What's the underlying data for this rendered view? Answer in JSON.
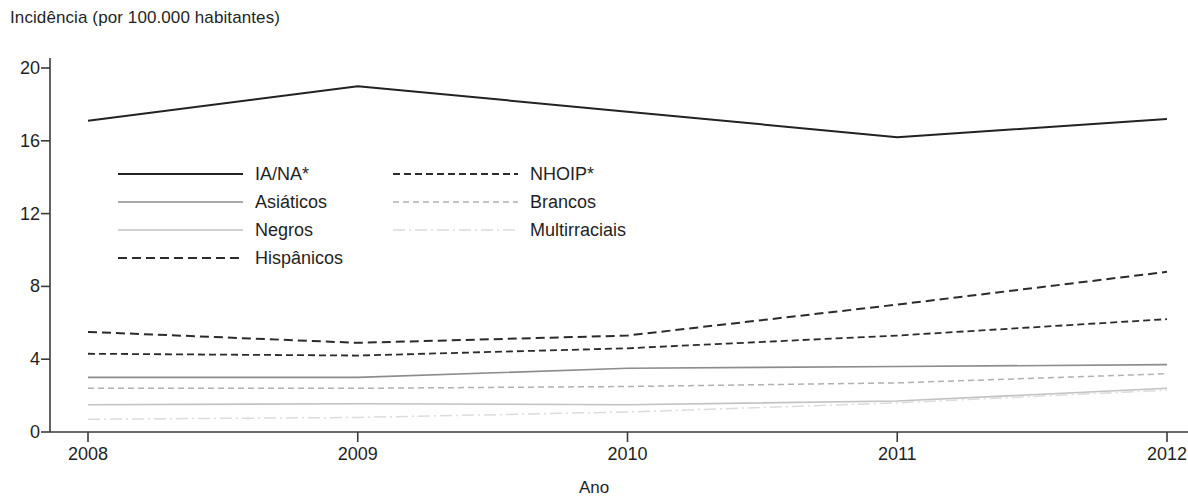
{
  "chart_data": {
    "type": "line",
    "title": "",
    "ylabel": "Incidência (por 100.000 habitantes)",
    "xlabel": "Ano",
    "x": [
      2008,
      2009,
      2010,
      2011,
      2012
    ],
    "categories": [
      "2008",
      "2009",
      "2010",
      "2011",
      "2012"
    ],
    "xtick_labels": [
      "2008",
      "2009",
      "2010",
      "2011",
      "2012"
    ],
    "ytick_labels": [
      "0",
      "4",
      "8",
      "12",
      "16",
      "20"
    ],
    "yticks": [
      0,
      4,
      8,
      12,
      16,
      20
    ],
    "ylim": [
      0,
      20
    ],
    "xlim": [
      2008,
      2012
    ],
    "grid": false,
    "legend_position": "upper-left-inside",
    "footnote": "",
    "series": [
      {
        "name": "IA/NA*",
        "style": "solid",
        "color": "#222222",
        "width": 2.0,
        "values": [
          17.1,
          19.0,
          17.6,
          16.2,
          17.2
        ]
      },
      {
        "name": "Asiáticos",
        "style": "solid",
        "color": "#8c8c8c",
        "width": 1.6,
        "values": [
          3.0,
          3.0,
          3.5,
          3.6,
          3.7
        ]
      },
      {
        "name": "Negros",
        "style": "solid",
        "color": "#c2c2c2",
        "width": 1.6,
        "values": [
          1.5,
          1.55,
          1.5,
          1.7,
          2.4
        ]
      },
      {
        "name": "Hispânicos",
        "style": "dashed",
        "color": "#2b2b2b",
        "width": 2.0,
        "values": [
          5.5,
          4.9,
          5.3,
          7.0,
          8.8
        ]
      },
      {
        "name": "NHOIP*",
        "style": "dashed-fine",
        "color": "#2b2b2b",
        "width": 1.8,
        "values": [
          4.3,
          4.2,
          4.6,
          5.3,
          6.2
        ]
      },
      {
        "name": "Brancos",
        "style": "dashed-light",
        "color": "#b0b0b0",
        "width": 1.5,
        "values": [
          2.4,
          2.4,
          2.5,
          2.7,
          3.2
        ]
      },
      {
        "name": "Multirraciais",
        "style": "dashdot-light",
        "color": "#dcdcdc",
        "width": 1.5,
        "values": [
          0.7,
          0.8,
          1.1,
          1.6,
          2.3
        ]
      }
    ]
  },
  "legend": {
    "columns": [
      {
        "items": [
          {
            "label": "IA/NA*",
            "series": "IA/NA*"
          },
          {
            "label": "Asiáticos",
            "series": "Asiáticos"
          },
          {
            "label": "Negros",
            "series": "Negros"
          },
          {
            "label": "Hispânicos",
            "series": "Hispânicos"
          }
        ]
      },
      {
        "items": [
          {
            "label": "NHOIP*",
            "series": "NHOIP*"
          },
          {
            "label": "Brancos",
            "series": "Brancos"
          },
          {
            "label": "Multirraciais",
            "series": "Multirraciais"
          }
        ]
      }
    ]
  },
  "axes": {
    "y_title": "Incidência (por 100.000 habitantes)",
    "x_title": "Ano",
    "axis_color": "#3a3a3a"
  }
}
